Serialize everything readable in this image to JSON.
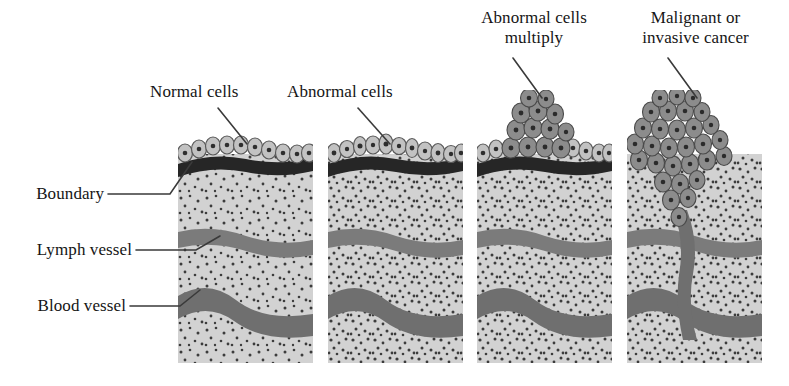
{
  "figure": {
    "type": "biomedical-diagram",
    "background": "#ffffff",
    "palette": {
      "stroma": "#d2d2d2",
      "stroma_speckle": "#3c3c3c",
      "vessel": "#7b7b7b",
      "vessel_dark": "#6f6f6f",
      "basement_membrane": "#262626",
      "normal_cell_fill": "#c2c2c2",
      "normal_cell_outline": "#5a5a5a",
      "nucleus": "#2e2e2e",
      "tumor_cell_fill": "#8c8c8c",
      "tumor_cell_outline": "#4a4a4a",
      "text": "#151515",
      "leader_line": "#3a3a3a"
    }
  },
  "labels": {
    "normal_cells": "Normal cells",
    "abnormal_cells": "Abnormal cells",
    "abnormal_multiply_line1": "Abnormal cells",
    "abnormal_multiply_line2": "multiply",
    "malignant_line1": "Malignant or",
    "malignant_line2": "invasive cancer",
    "boundary": "Boundary",
    "lymph_vessel": "Lymph vessel",
    "blood_vessel": "Blood vessel"
  },
  "panels": [
    {
      "id": "panel-normal",
      "stage": 1,
      "caption": "Normal cells",
      "x": 178,
      "y": 133,
      "width": 135,
      "height": 230,
      "epithelium": "single ordered row of oval normal cells",
      "tumor": "none",
      "boundary_intact": true
    },
    {
      "id": "panel-abnormal",
      "stage": 2,
      "caption": "Abnormal cells",
      "x": 328,
      "y": 133,
      "width": 135,
      "height": 230,
      "epithelium": "row of irregular abnormal cells",
      "tumor": "none",
      "boundary_intact": true
    },
    {
      "id": "panel-multiply",
      "stage": 3,
      "caption": "Abnormal cells multiply",
      "x": 477,
      "y": 133,
      "width": 135,
      "height": 230,
      "epithelium": "row with raised dark cell mass above surface",
      "tumor": "mound of dark tumor cells above boundary",
      "boundary_intact": true
    },
    {
      "id": "panel-malignant",
      "stage": 4,
      "caption": "Malignant or invasive cancer",
      "x": 627,
      "y": 133,
      "width": 135,
      "height": 230,
      "epithelium": "disorganized mass replacing surface",
      "tumor": "large tumor mass invading through boundary into vessels",
      "boundary_intact": false
    }
  ],
  "annotations": [
    {
      "name": "normal-cells",
      "text": "Normal cells",
      "text_x": 152,
      "text_y": 88,
      "leader_from": [
        218,
        108
      ],
      "leader_to": [
        246,
        143
      ]
    },
    {
      "name": "abnormal-cells",
      "text": "Abnormal cells",
      "text_x": 289,
      "text_y": 88,
      "leader_from": [
        358,
        108
      ],
      "leader_to": [
        389,
        143
      ]
    },
    {
      "name": "abnormal-cells-multiply",
      "text": "Abnormal cells multiply",
      "text_x": 468,
      "text_y": 10,
      "leader_from": [
        512,
        58
      ],
      "leader_to": [
        541,
        97
      ]
    },
    {
      "name": "malignant-invasive-cancer",
      "text": "Malignant or invasive cancer",
      "text_x": 618,
      "text_y": 10,
      "leader_from": [
        668,
        58
      ],
      "leader_to": [
        697,
        97
      ]
    },
    {
      "name": "boundary",
      "text": "Boundary",
      "text_x": 14,
      "text_y": 185,
      "leader_from": [
        112,
        194
      ],
      "leader_to": [
        190,
        161
      ]
    },
    {
      "name": "lymph-vessel",
      "text": "Lymph vessel",
      "text_x": 14,
      "text_y": 241,
      "leader_from": [
        138,
        250
      ],
      "leader_to": [
        216,
        235
      ]
    },
    {
      "name": "blood-vessel",
      "text": "Blood vessel",
      "text_x": 14,
      "text_y": 297,
      "leader_from": [
        133,
        306
      ],
      "leader_to": [
        196,
        288
      ]
    }
  ]
}
